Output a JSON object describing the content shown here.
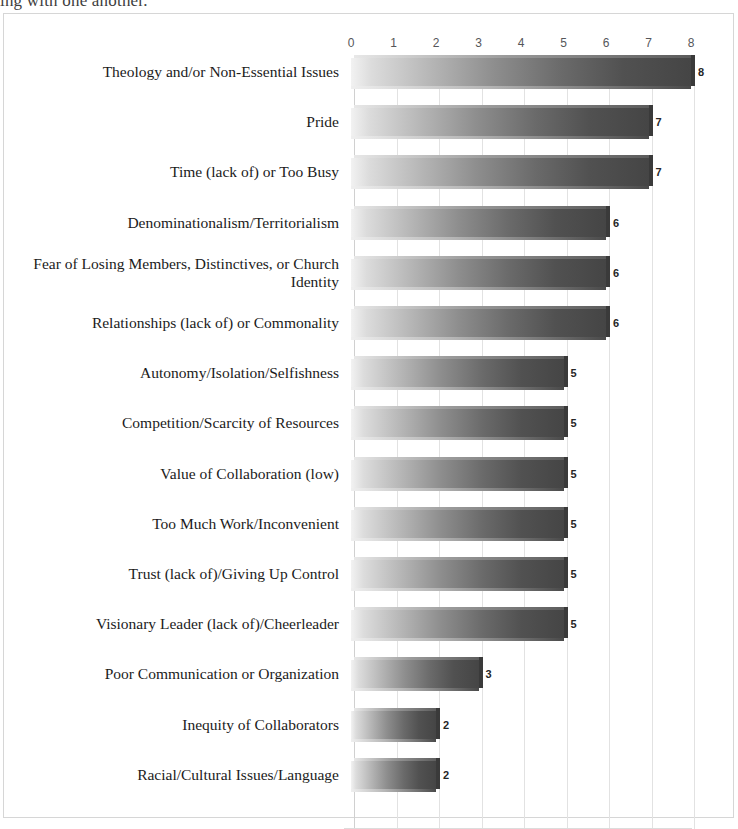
{
  "scan": {
    "cut_off_top_line": "ing with one another."
  },
  "chart_data": {
    "type": "bar",
    "orientation": "horizontal",
    "title": "",
    "subtitle": "",
    "xlabel": "",
    "ylabel": "",
    "xlim": [
      0,
      8
    ],
    "xticks": [
      0,
      1,
      2,
      3,
      4,
      5,
      6,
      7,
      8
    ],
    "xtick_labels": [
      "0",
      "1",
      "2",
      "3",
      "4",
      "5",
      "6",
      "7",
      "8"
    ],
    "grid": "vertical",
    "legend": "none",
    "data_labels": true,
    "bar_style": "gradient-3d-light-to-dark",
    "categories": [
      "Theology and/or Non-Essential Issues",
      "Pride",
      "Time (lack of) or Too Busy",
      "Denominationalism/Territorialism",
      "Fear of Losing Members, Distinctives, or Church Identity",
      "Relationships (lack of) or Commonality",
      "Autonomy/Isolation/Selfishness",
      "Competition/Scarcity of Resources",
      "Value of Collaboration (low)",
      "Too Much Work/Inconvenient",
      "Trust (lack of)/Giving Up Control",
      "Visionary Leader (lack of)/Cheerleader",
      "Poor Communication or Organization",
      "Inequity of Collaborators",
      "Racial/Cultural Issues/Language"
    ],
    "values": [
      8,
      7,
      7,
      6,
      6,
      6,
      5,
      5,
      5,
      5,
      5,
      5,
      3,
      2,
      2
    ],
    "value_labels": [
      "8",
      "7",
      "7",
      "6",
      "6",
      "6",
      "5",
      "5",
      "5",
      "5",
      "5",
      "5",
      "3",
      "2",
      "2"
    ]
  },
  "colors": {
    "bar_light": "#f2f2f2",
    "bar_dark": "#454545",
    "bar_side": "#3a3a3a",
    "gridline": "#e2e2e2",
    "frame": "#d6d6d6",
    "tick_text": "#55565a",
    "category_text": "#1b1b1b",
    "value_text": "#262626",
    "background": "#ffffff"
  }
}
